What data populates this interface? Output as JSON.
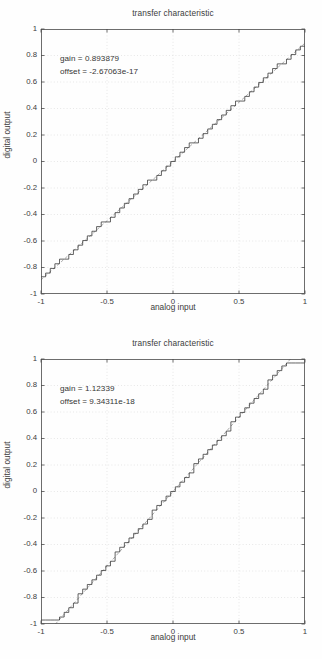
{
  "page": {
    "background": "#ffffff",
    "width": 322,
    "height": 659
  },
  "style": {
    "axis_color": "#4a4a4a",
    "grid_color": "#d8d8d8",
    "staircase_color": "#303030",
    "ideal_line_color": "#8a8a8a",
    "text_color": "#3c3c3c"
  },
  "figures": [
    {
      "id": "figure-1",
      "title": "transfer characteristic",
      "xlabel": "analog input",
      "ylabel": "digital output",
      "annotations": {
        "gain_label": "gain = 0.893879",
        "offset_label": "offset = -2.67063e-17"
      }
    },
    {
      "id": "figure-2",
      "title": "transfer characteristic",
      "xlabel": "analog input",
      "ylabel": "digital output",
      "annotations": {
        "gain_label": "gain = 1.12339",
        "offset_label": "offset = 9.34311e-18"
      }
    }
  ],
  "chart_data": [
    {
      "type": "line",
      "title": "transfer characteristic",
      "xlabel": "analog input",
      "ylabel": "digital output",
      "xlim": [
        -1,
        1
      ],
      "ylim": [
        -1,
        1
      ],
      "xticks": [
        -1,
        -0.5,
        0,
        0.5,
        1
      ],
      "xticklabels": [
        "-1",
        "-0.5",
        "0",
        "0.5",
        "1"
      ],
      "yticks": [
        -1,
        -0.8,
        -0.6,
        -0.4,
        -0.2,
        0,
        0.2,
        0.4,
        0.6,
        0.8,
        1
      ],
      "yticklabels": [
        "-1",
        "-0.8",
        "-0.6",
        "-0.4",
        "-0.2",
        "0",
        "0.2",
        "0.4",
        "0.6",
        "0.8",
        "1"
      ],
      "grid": true,
      "legend": "none",
      "annotations": [
        {
          "text": "gain = 0.893879",
          "x": -0.71,
          "y": 0.81
        },
        {
          "text": "offset = -2.67063e-17",
          "x": -0.71,
          "y": 0.71
        }
      ],
      "gain": 0.893879,
      "offset": -2.67063e-17,
      "quantizer_levels": 64,
      "clipped": false,
      "series": [
        {
          "name": "quantized staircase",
          "style": "step",
          "color": "#303030",
          "x_start": -1,
          "x_end": 1,
          "step_count": 57,
          "y_min": -0.87,
          "y_max": 0.87
        },
        {
          "name": "ideal line",
          "style": "dashed",
          "color": "#8a8a8a",
          "x": [
            -1,
            1
          ],
          "values": [
            -0.893879,
            0.893879
          ]
        }
      ]
    },
    {
      "type": "line",
      "title": "transfer characteristic",
      "xlabel": "analog input",
      "ylabel": "digital output",
      "xlim": [
        -1,
        1
      ],
      "ylim": [
        -1,
        1
      ],
      "xticks": [
        -1,
        -0.5,
        0,
        0.5,
        1
      ],
      "xticklabels": [
        "-1",
        "-0.5",
        "0",
        "0.5",
        "1"
      ],
      "yticks": [
        -1,
        -0.8,
        -0.6,
        -0.4,
        -0.2,
        0,
        0.2,
        0.4,
        0.6,
        0.8,
        1
      ],
      "yticklabels": [
        "-1",
        "-0.8",
        "-0.6",
        "-0.4",
        "-0.2",
        "0",
        "0.2",
        "0.4",
        "0.6",
        "0.8",
        "1"
      ],
      "grid": true,
      "legend": "none",
      "annotations": [
        {
          "text": "gain = 1.12339",
          "x": -0.71,
          "y": 0.81
        },
        {
          "text": "offset = 9.34311e-18",
          "x": -0.71,
          "y": 0.71
        }
      ],
      "gain": 1.12339,
      "offset": 9.34311e-18,
      "quantizer_levels": 64,
      "clipped": true,
      "clip_low_until_x": -0.83,
      "clip_high_from_x": 0.83,
      "series": [
        {
          "name": "quantized staircase",
          "style": "step",
          "color": "#303030",
          "x_start": -1,
          "x_end": 1,
          "step_count": 57,
          "y_min": -0.97,
          "y_max": 0.97
        },
        {
          "name": "ideal line",
          "style": "dashed",
          "color": "#8a8a8a",
          "x": [
            -0.89,
            0.89
          ],
          "values": [
            -1,
            1
          ]
        }
      ]
    }
  ]
}
